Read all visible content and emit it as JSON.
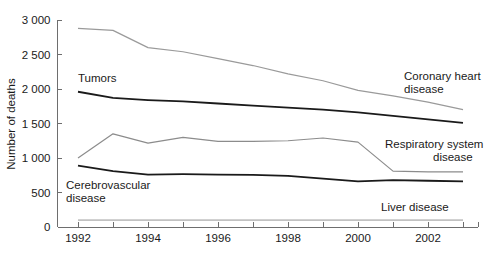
{
  "chart_data": {
    "type": "line",
    "title": "",
    "xlabel": "",
    "ylabel": "Number of deaths",
    "xlim": [
      1992,
      2003
    ],
    "ylim": [
      0,
      3000
    ],
    "grid": false,
    "legend_position": "inline-right-annotations",
    "x": [
      1992,
      1993,
      1994,
      1995,
      1996,
      1997,
      1998,
      1999,
      2000,
      2001,
      2002,
      2003
    ],
    "x_tick_labels": [
      "1992",
      "1994",
      "1996",
      "1998",
      "2000",
      "2002"
    ],
    "x_tick_values": [
      1992,
      1994,
      1996,
      1998,
      2000,
      2002
    ],
    "y_tick_labels": [
      "0",
      "500",
      "1 000",
      "1 500",
      "2 000",
      "2 500",
      "3 000"
    ],
    "y_tick_values": [
      0,
      500,
      1000,
      1500,
      2000,
      2500,
      3000
    ],
    "series": [
      {
        "name": "Coronary heart disease",
        "label": "Coronary heart",
        "label_line2": "disease",
        "color": "#9a9a9a",
        "stroke_width": 1.2,
        "values": [
          2880,
          2850,
          2600,
          2540,
          2440,
          2340,
          2220,
          2120,
          1980,
          1900,
          1810,
          1700
        ]
      },
      {
        "name": "Tumors",
        "label": "Tumors",
        "label_line2": "",
        "color": "#1a1a1a",
        "stroke_width": 1.8,
        "values": [
          1960,
          1870,
          1840,
          1820,
          1790,
          1760,
          1730,
          1700,
          1660,
          1610,
          1560,
          1510
        ]
      },
      {
        "name": "Respiratory system disease",
        "label": "Respiratory system",
        "label_line2": "disease",
        "color": "#8c8c8c",
        "stroke_width": 1.2,
        "values": [
          1000,
          1350,
          1215,
          1300,
          1240,
          1240,
          1250,
          1290,
          1230,
          810,
          800,
          800
        ]
      },
      {
        "name": "Cerebrovascular disease",
        "label": "Cerebrovascular",
        "label_line2": "disease",
        "color": "#1a1a1a",
        "stroke_width": 1.8,
        "values": [
          890,
          810,
          760,
          765,
          760,
          755,
          740,
          700,
          660,
          680,
          670,
          660
        ]
      },
      {
        "name": "Liver disease",
        "label": "Liver disease",
        "label_line2": "",
        "color": "#c2c2c2",
        "stroke_width": 1.6,
        "values": [
          100,
          100,
          100,
          100,
          100,
          100,
          100,
          100,
          100,
          100,
          100,
          100
        ]
      }
    ],
    "annotations": [
      {
        "name": "tumors-annotation",
        "text": "Tumors",
        "x_px": 78,
        "y_px": 82
      },
      {
        "name": "coronary-heart-disease-annotation",
        "text": "Coronary heart",
        "x_px": 404,
        "y_px": 80
      },
      {
        "name": "coronary-heart-disease-annotation-line2",
        "text": "disease",
        "x_px": 404,
        "y_px": 93
      },
      {
        "name": "respiratory-system-disease-annotation",
        "text": "Respiratory system",
        "x_px": 385,
        "y_px": 148
      },
      {
        "name": "respiratory-system-disease-annotation-line2",
        "text": "disease",
        "x_px": 433,
        "y_px": 161
      },
      {
        "name": "cerebrovascular-disease-annotation",
        "text": "Cerebrovascular",
        "x_px": 66,
        "y_px": 189
      },
      {
        "name": "cerebrovascular-disease-annotation-line2",
        "text": "disease",
        "x_px": 66,
        "y_px": 202
      },
      {
        "name": "liver-disease-annotation",
        "text": "Liver disease",
        "x_px": 381,
        "y_px": 211
      }
    ]
  },
  "axes": {
    "y_axis_title": "Number of deaths"
  }
}
